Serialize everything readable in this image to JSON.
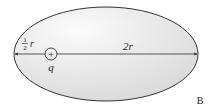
{
  "figure": {
    "label": "B",
    "ellipse": {
      "fill": "#e6e6e6",
      "stroke": "#333333"
    },
    "axis_segments": {
      "left_label_num": "1",
      "left_label_den": "2",
      "left_label_var": "r",
      "right_label": "2r"
    },
    "charge": {
      "sign": "+",
      "label": "q"
    }
  }
}
